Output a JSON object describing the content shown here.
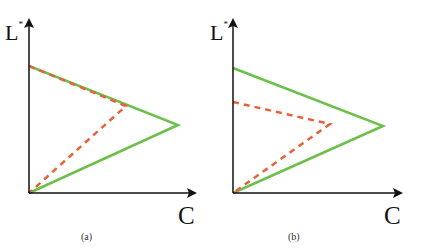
{
  "colors": {
    "axis": "#111111",
    "green": "#6dbf4b",
    "red": "#e8613a"
  },
  "panels": [
    {
      "id": "a",
      "caption": "(a)",
      "y_axis_label": "L",
      "y_axis_sup": "*",
      "x_axis_label": "C",
      "origin": [
        29,
        193
      ],
      "y_axis_tip": [
        29,
        20
      ],
      "x_axis_tip": [
        195,
        193
      ],
      "green_triangle": [
        [
          29,
          66
        ],
        [
          178,
          125
        ],
        [
          29,
          193
        ]
      ],
      "red_dashed": [
        [
          29,
          66
        ],
        [
          126,
          106
        ],
        [
          29,
          193
        ]
      ]
    },
    {
      "id": "b",
      "caption": "(b)",
      "y_axis_label": "L",
      "y_axis_sup": "*",
      "x_axis_label": "C",
      "origin": [
        233,
        193
      ],
      "y_axis_tip": [
        233,
        20
      ],
      "x_axis_tip": [
        401,
        193
      ],
      "green_triangle": [
        [
          233,
          68
        ],
        [
          383,
          126
        ],
        [
          233,
          193
        ]
      ],
      "red_dashed": [
        [
          233,
          102
        ],
        [
          330,
          124
        ],
        [
          233,
          193
        ]
      ]
    }
  ]
}
